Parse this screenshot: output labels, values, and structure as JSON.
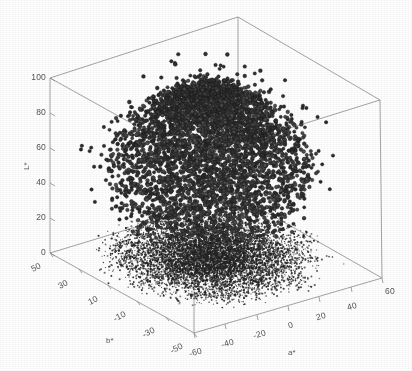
{
  "figure": {
    "width": 412,
    "height": 371,
    "background_color": "#ffffff"
  },
  "chart_data": {
    "type": "scatter",
    "projection": "3d",
    "title": "",
    "subtitle": "",
    "xlabel": "a*",
    "ylabel": "b*",
    "zlabel": "L*",
    "grid": false,
    "legend": null,
    "axes": {
      "a_star": {
        "label": "a*",
        "ticks": [
          -60,
          -40,
          -20,
          0,
          20,
          40,
          60
        ],
        "tick_labels": [
          "-60",
          "-40",
          "-20",
          "0",
          "20",
          "40",
          "60"
        ],
        "range": [
          -60,
          60
        ]
      },
      "b_star": {
        "label": "b*",
        "ticks": [
          50,
          30,
          10,
          -10,
          -30,
          -50
        ],
        "tick_labels": [
          "50",
          "30",
          "10",
          "-10",
          "-30",
          "-50"
        ],
        "range": [
          -60,
          60
        ]
      },
      "L_star": {
        "label": "L*",
        "ticks": [
          0,
          20,
          40,
          60,
          80,
          100
        ],
        "tick_labels": [
          "0",
          "20",
          "40",
          "60",
          "80",
          "100"
        ],
        "range": [
          0,
          100
        ]
      }
    },
    "series": [
      {
        "name": "points",
        "marker": "circle",
        "marker_color": "#3c3c3c",
        "marker_edge_color": "#1a1a1a",
        "marker_size": 3.4,
        "approx_count": 5200,
        "description": "Dense cloud of L*a*b* color samples spanning L* 15-100, a* -45..55, b* -50..50"
      },
      {
        "name": "floor-projection",
        "marker": "dot",
        "marker_color": "#222222",
        "marker_size": 1.1,
        "approx_count": 7000,
        "description": "Dark projected shadow of the cloud onto the L*=0 floor plane"
      }
    ],
    "box_color": "#8d8d8d",
    "tick_label_color": "#555555"
  },
  "tick_labels": {
    "L": [
      "100",
      "80",
      "60",
      "40",
      "20",
      "0"
    ],
    "b": [
      "50",
      "30",
      "10",
      "-10",
      "-30",
      "-50"
    ],
    "a": [
      "-60",
      "-40",
      "-20",
      "0",
      "20",
      "40",
      "60"
    ]
  },
  "axis_titles": {
    "L": "L*",
    "b": "b*",
    "a": "a*"
  }
}
